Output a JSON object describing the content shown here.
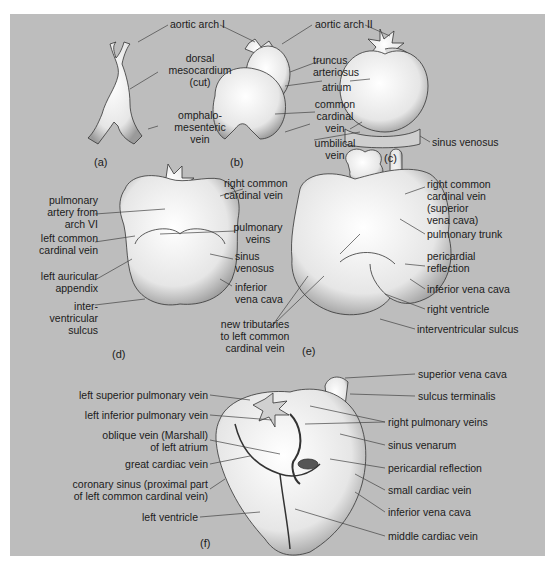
{
  "figure": {
    "background_color": "#bdbdbd",
    "organ_color": "#f2f2f2",
    "line_color": "#333333",
    "panels": [
      {
        "id": "a",
        "caption": "(a)",
        "labels": [
          "aortic arch I",
          "dorsal mesocardium (cut)",
          "omphalo-mesenteric vein"
        ]
      },
      {
        "id": "b",
        "caption": "(b)",
        "labels": [
          "truncus arteriosus",
          "atrium",
          "common cardinal vein",
          "umbilical vein"
        ]
      },
      {
        "id": "c",
        "caption": "(c)",
        "labels": [
          "aortic arch II",
          "sinus venosus"
        ]
      },
      {
        "id": "d",
        "caption": "(d)",
        "labels": [
          "pulmonary artery from arch VI",
          "right common cardinal vein",
          "pulmonary veins",
          "left common cardinal vein",
          "sinus venosus",
          "left auricular appendix",
          "inferior vena cava",
          "inter-ventricular sulcus"
        ]
      },
      {
        "id": "e",
        "caption": "(e)",
        "labels": [
          "right common cardinal vein (superior vena cava)",
          "pulmonary trunk",
          "pericardial reflection",
          "inferior vena cava",
          "right ventricle",
          "interventricular sulcus",
          "new tributaries to left common cardinal vein"
        ]
      },
      {
        "id": "f",
        "caption": "(f)",
        "labels": [
          "superior vena cava",
          "sulcus terminalis",
          "left superior pulmonary vein",
          "left inferior pulmonary vein",
          "right pulmonary veins",
          "oblique vein (Marshall) of left atrium",
          "sinus venarum",
          "great cardiac vein",
          "pericardial reflection",
          "coronary sinus (proximal part of left common cardinal vein)",
          "small cardiac vein",
          "left ventricle",
          "inferior vena cava",
          "middle cardiac vein"
        ]
      }
    ]
  },
  "labels": {
    "a_aortic_arch_1": "aortic arch I",
    "a_dorsal_1": "dorsal",
    "a_dorsal_2": "mesocardium",
    "a_dorsal_3": "(cut)",
    "a_omph_1": "omphalo-",
    "a_omph_2": "mesenteric",
    "a_omph_3": "vein",
    "a_caption": "(a)",
    "b_truncus_1": "truncus",
    "b_truncus_2": "arteriosus",
    "b_atrium": "atrium",
    "b_ccv_1": "common",
    "b_ccv_2": "cardinal",
    "b_ccv_3": "vein",
    "b_umb_1": "umbilical",
    "b_umb_2": "vein",
    "b_caption": "(b)",
    "c_aortic_arch_2": "aortic arch II",
    "c_sinus_venosus": "sinus venosus",
    "c_caption": "(c)",
    "d_pa_1": "pulmonary",
    "d_pa_2": "artery from",
    "d_pa_3": "arch VI",
    "d_rccv_1": "right common",
    "d_rccv_2": "cardinal vein",
    "d_pv_1": "pulmonary",
    "d_pv_2": "veins",
    "d_lccv_1": "left common",
    "d_lccv_2": "cardinal vein",
    "d_sv_1": "sinus",
    "d_sv_2": "venosus",
    "d_laa_1": "left auricular",
    "d_laa_2": "appendix",
    "d_ivc_1": "inferior",
    "d_ivc_2": "vena cava",
    "d_ivs_1": "inter-",
    "d_ivs_2": "ventricular",
    "d_ivs_3": "sulcus",
    "d_caption": "(d)",
    "e_rccv_1": "right common",
    "e_rccv_2": "cardinal vein",
    "e_rccv_3": "(superior",
    "e_rccv_4": "vena cava)",
    "e_pt": "pulmonary trunk",
    "e_pr_1": "pericardial",
    "e_pr_2": "reflection",
    "e_ivc": "inferior vena cava",
    "e_rv": "right ventricle",
    "e_ivs": "interventricular sulcus",
    "e_nt_1": "new tributaries",
    "e_nt_2": "to left common",
    "e_nt_3": "cardinal vein",
    "e_caption": "(e)",
    "f_svc": "superior vena cava",
    "f_st": "sulcus terminalis",
    "f_lspv": "left superior pulmonary vein",
    "f_lipv": "left inferior pulmonary vein",
    "f_rpv": "right pulmonary veins",
    "f_ov_1": "oblique vein (Marshall)",
    "f_ov_2": "of left atrium",
    "f_sven": "sinus venarum",
    "f_gcv": "great cardiac vein",
    "f_pr": "pericardial reflection",
    "f_cs_1": "coronary sinus (proximal part",
    "f_cs_2": "of left common cardinal vein)",
    "f_scv": "small cardiac vein",
    "f_lv": "left ventricle",
    "f_ivc": "inferior vena cava",
    "f_mcv": "middle cardiac vein",
    "f_caption": "(f)"
  }
}
